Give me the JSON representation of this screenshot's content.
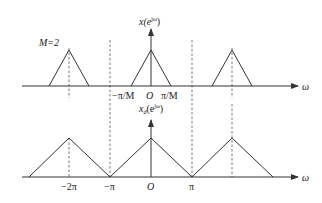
{
  "top_plot": {
    "y_label": "x(e",
    "y_label_sup": "jω",
    "y_label_close": ")",
    "x_label": "ω",
    "annotation": "M=2",
    "tick_labels": {
      "neg_pi_over_m": "−π/M",
      "origin": "O",
      "pi_over_m": "π/M"
    },
    "triangles_centers": [
      "-2π",
      "0",
      "2π"
    ]
  },
  "bottom_plot": {
    "y_label": "x",
    "y_label_sub": "d",
    "y_label_mid": "(e",
    "y_label_sup": "jω",
    "y_label_close": ")",
    "x_label": "ω",
    "tick_labels": {
      "neg_2pi": "−2π",
      "neg_pi": "−π",
      "origin": "O",
      "pi": "π"
    },
    "triangles_centers": [
      "-2π",
      "0",
      "2π"
    ]
  },
  "colors": {
    "line": "#333333",
    "dashed": "#555555",
    "background": "#ffffff"
  }
}
